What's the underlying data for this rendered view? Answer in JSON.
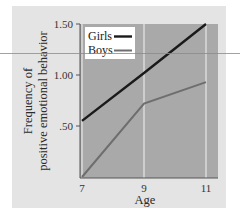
{
  "chart_data": {
    "type": "line",
    "title": "",
    "xlabel": "Age",
    "ylabel": "Frequency of positive emotional behavior",
    "ylabel_lines": [
      "Frequency of",
      "positive emotional behavior"
    ],
    "x": [
      7,
      9,
      11
    ],
    "x_tick_labels": [
      "7",
      "9",
      "11"
    ],
    "y_tick_labels": [
      ".50",
      "1.00",
      "1.50"
    ],
    "y_ticks": [
      0.5,
      1.0,
      1.5
    ],
    "xlim": [
      7,
      11.35
    ],
    "ylim": [
      0,
      1.5
    ],
    "grid": "vertical lines at x=7, 9, 11",
    "legend_position": "upper left",
    "series": [
      {
        "name": "Girls",
        "color": "#1a1a1a",
        "values": [
          0.55,
          1.02,
          1.5
        ]
      },
      {
        "name": "Boys",
        "color": "#6e6e6e",
        "values": [
          0.0,
          0.72,
          0.93
        ]
      }
    ]
  },
  "colors": {
    "plot_bg": "#a9a9a9",
    "frame_bg": "#e4e4e4",
    "grid": "#e8e8e8"
  }
}
